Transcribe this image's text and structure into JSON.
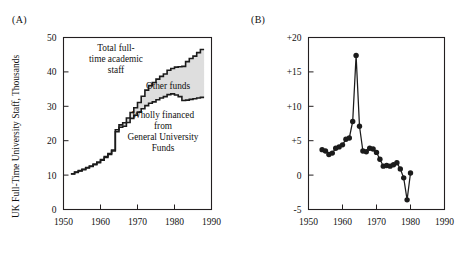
{
  "figure": {
    "panel_a": {
      "label": "(A)",
      "ylabel": "UK Full-Time University Staff, Thousands",
      "annotations": {
        "total": [
          "Total full-",
          "time academic",
          "staff"
        ],
        "other": "Other funds",
        "wholly": [
          "Wholly financed",
          "from",
          "General University",
          "Funds"
        ]
      }
    },
    "panel_b": {
      "label": "(B)",
      "ylabel": "Annual rates of change, %"
    }
  },
  "chart_data": [
    {
      "type": "area",
      "panel": "(A)",
      "title": "",
      "xlabel": "",
      "ylabel": "UK Full-Time University Staff, Thousands",
      "xlim": [
        1950,
        1990
      ],
      "ylim": [
        0,
        50
      ],
      "xticks": [
        1950,
        1960,
        1970,
        1980,
        1990
      ],
      "yticks": [
        0,
        10,
        20,
        30,
        40,
        50
      ],
      "xtick_labels": [
        "1950",
        "1960",
        "1970",
        "1980",
        "1990"
      ],
      "ytick_labels": [
        "0",
        "10",
        "20",
        "30",
        "40",
        "50"
      ],
      "grid": false,
      "legend": "inline-annotations",
      "step_style": "post",
      "x": [
        1952,
        1953,
        1954,
        1955,
        1956,
        1957,
        1958,
        1959,
        1960,
        1961,
        1962,
        1963,
        1964,
        1965,
        1966,
        1967,
        1968,
        1969,
        1970,
        1971,
        1972,
        1973,
        1974,
        1975,
        1976,
        1977,
        1978,
        1979,
        1980,
        1981,
        1982,
        1983,
        1984,
        1985,
        1986,
        1987
      ],
      "series": [
        {
          "name": "Wholly financed from General University Funds",
          "fill": "white",
          "values": [
            10.3,
            10.8,
            11.2,
            11.6,
            12.1,
            12.5,
            13.0,
            13.6,
            14.3,
            15.1,
            16.0,
            17.0,
            22.6,
            23.9,
            24.2,
            25.3,
            26.5,
            27.4,
            28.3,
            29.3,
            30.2,
            30.9,
            31.3,
            31.9,
            32.4,
            32.8,
            33.4,
            33.6,
            33.3,
            32.8,
            31.7,
            31.8,
            32.0,
            32.2,
            32.4,
            32.6
          ]
        },
        {
          "name": "Total full-time academic staff",
          "fill": "none",
          "values": [
            10.4,
            10.9,
            11.3,
            11.7,
            12.2,
            12.6,
            13.2,
            13.8,
            14.5,
            15.4,
            16.3,
            17.3,
            23.2,
            24.6,
            25.2,
            26.6,
            28.2,
            29.6,
            31.1,
            32.9,
            34.7,
            36.0,
            36.9,
            37.9,
            38.7,
            39.4,
            40.5,
            41.0,
            41.4,
            41.5,
            41.6,
            43.0,
            43.9,
            44.6,
            45.6,
            46.5
          ]
        }
      ],
      "band_label": "Other funds",
      "band_description": "Shaded region between the two curves represents staff funded by Other funds"
    },
    {
      "type": "line",
      "panel": "(B)",
      "title": "",
      "xlabel": "",
      "ylabel": "Annual rates of change, %",
      "xlim": [
        1950,
        1990
      ],
      "ylim": [
        -5,
        20
      ],
      "xticks": [
        1950,
        1960,
        1970,
        1980,
        1990
      ],
      "yticks": [
        -5,
        0,
        5,
        10,
        15,
        20
      ],
      "xtick_labels": [
        "1950",
        "1960",
        "1970",
        "1980",
        "1990"
      ],
      "ytick_labels": [
        "-5",
        "0",
        "+5",
        "+10",
        "+15",
        "+20"
      ],
      "grid": false,
      "marker": "filled-circle",
      "x": [
        1954,
        1955,
        1956,
        1957,
        1958,
        1959,
        1960,
        1961,
        1962,
        1963,
        1964,
        1965,
        1966,
        1967,
        1968,
        1969,
        1970,
        1971,
        1972,
        1973,
        1974,
        1975,
        1976,
        1977,
        1978,
        1979,
        1980,
        1981,
        1982,
        1983,
        1984
      ],
      "values": [
        3.7,
        3.5,
        3.0,
        3.2,
        3.9,
        4.1,
        4.4,
        5.2,
        5.4,
        7.8,
        17.4,
        7.1,
        3.5,
        3.4,
        3.9,
        3.8,
        3.3,
        2.3,
        1.3,
        1.4,
        1.3,
        1.5,
        1.8,
        0.9,
        -0.4,
        -3.6,
        0.3
      ]
    }
  ]
}
